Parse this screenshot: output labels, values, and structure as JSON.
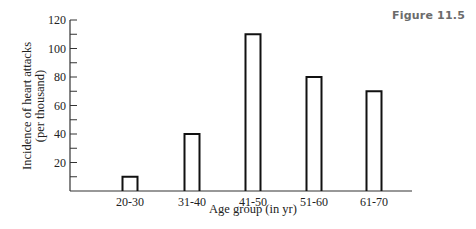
{
  "figure_label": "Figure 11.5",
  "chart_data": {
    "type": "bar",
    "title": "",
    "categories": [
      "20-30",
      "31-40",
      "41-50",
      "51-60",
      "61-70"
    ],
    "values": [
      10,
      40,
      110,
      80,
      70
    ],
    "xlabel": "Age group (in yr)",
    "ylabel": "Incidence of heart attacks",
    "ylabel_line2": "(per thousand)",
    "ylim": [
      0,
      120
    ],
    "yticks_labeled": [
      20,
      40,
      60,
      80,
      100,
      120
    ],
    "yticks_minor_step": 10,
    "grid": false,
    "legend": null,
    "bar_style": "outline"
  }
}
